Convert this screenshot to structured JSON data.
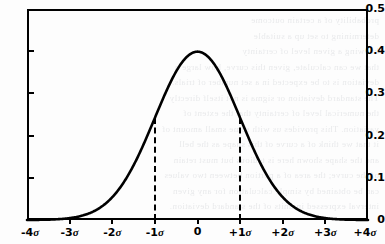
{
  "figure": {
    "background_color": "#fdfdfd",
    "ink_color": "#000000",
    "ghost_text_color": "#b9bcc2",
    "ghost_lines": [
      "probability of a certain outcome",
      "determining to set up a suitable",
      "knowing a given level of certainty",
      "that we can calculate, given this curve, how large a",
      "deviation is to be expected in a set number of trials.",
      "The standard deviation or sigma is not itself directly",
      "the numerical level of certainty that the extent of",
      "variation. This provides us with some small amount of",
      "it that we think of a curve of this shape as the bell",
      "and the shape shown here is tedious but must retain",
      "of the curve; the area of a portion between two values",
      "can be obtained by simple calculation for any given",
      "interval expressed in units of the standard deviation."
    ]
  },
  "chart_data": {
    "type": "line",
    "title": "",
    "xlabel": "",
    "ylabel": "",
    "xlim": [
      -4,
      4
    ],
    "ylim": [
      0,
      0.5
    ],
    "grid": false,
    "legend": null,
    "x_tick_values": [
      -4,
      -3,
      -2,
      -1,
      0,
      1,
      2,
      3,
      4
    ],
    "x_tick_labels": [
      "-4σ",
      "-3σ",
      "-2σ",
      "-1σ",
      "0",
      "+1σ",
      "+2σ",
      "+3σ",
      "+4σ"
    ],
    "y_tick_values": [
      0,
      0.1,
      0.2,
      0.3,
      0.4,
      0.5
    ],
    "y_tick_labels": [
      "0",
      "0.1",
      "0.2",
      "0.3",
      "0.4",
      "0.5"
    ],
    "series": [
      {
        "name": "standard normal probability density",
        "formula": "phi(x) = (1/sqrt(2*pi)) * exp(-x^2/2)",
        "x": [
          -4.0,
          -3.75,
          -3.5,
          -3.25,
          -3.0,
          -2.75,
          -2.5,
          -2.25,
          -2.0,
          -1.75,
          -1.5,
          -1.25,
          -1.0,
          -0.75,
          -0.5,
          -0.25,
          0.0,
          0.25,
          0.5,
          0.75,
          1.0,
          1.25,
          1.5,
          1.75,
          2.0,
          2.25,
          2.5,
          2.75,
          3.0,
          3.25,
          3.5,
          3.75,
          4.0
        ],
        "values": [
          0.0001,
          0.0004,
          0.0009,
          0.002,
          0.0044,
          0.0091,
          0.0175,
          0.0317,
          0.054,
          0.0863,
          0.1295,
          0.1826,
          0.242,
          0.3011,
          0.3521,
          0.3867,
          0.3989,
          0.3867,
          0.3521,
          0.3011,
          0.242,
          0.1826,
          0.1295,
          0.0863,
          0.054,
          0.0317,
          0.0175,
          0.0091,
          0.0044,
          0.002,
          0.0009,
          0.0004,
          0.0001
        ]
      }
    ],
    "annotations": [
      {
        "name": "minus-one-sigma-dashed-line",
        "type": "vline-dashed",
        "x": -1,
        "y_from": 0,
        "y_to": 0.242,
        "label": "-1σ"
      },
      {
        "name": "plus-one-sigma-dashed-line",
        "type": "vline-dashed",
        "x": 1,
        "y_from": 0,
        "y_to": 0.242,
        "label": "+1σ"
      }
    ],
    "peak": {
      "x": 0,
      "y": 0.399
    }
  }
}
